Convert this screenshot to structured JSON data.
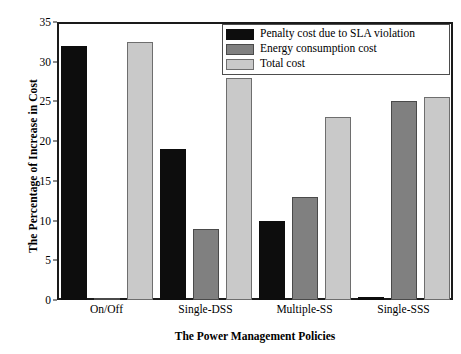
{
  "chart_data": {
    "type": "bar",
    "title": "",
    "xlabel": "The Power Management Policies",
    "ylabel": "The Percentage of Increase in Cost",
    "categories": [
      "On/Off",
      "Single-DSS",
      "Multiple-SS",
      "Single-SSS"
    ],
    "series": [
      {
        "name": "Penalty cost due to SLA violation",
        "color": "#0d0d0d",
        "values": [
          32,
          19,
          10,
          0.4
        ]
      },
      {
        "name": "Energy consumption cost",
        "color": "#808080",
        "values": [
          0.3,
          9,
          13,
          25
        ]
      },
      {
        "name": "Total cost",
        "color": "#c9c9c9",
        "values": [
          32.5,
          28,
          23,
          25.5
        ]
      }
    ],
    "ylim": [
      0,
      35
    ],
    "yticks": [
      0,
      5,
      10,
      15,
      20,
      25,
      30,
      35
    ],
    "ytick_labels": [
      "0",
      "5",
      "10",
      "15",
      "20",
      "25",
      "30",
      "35"
    ],
    "grid": false,
    "legend_position": "top-right"
  }
}
